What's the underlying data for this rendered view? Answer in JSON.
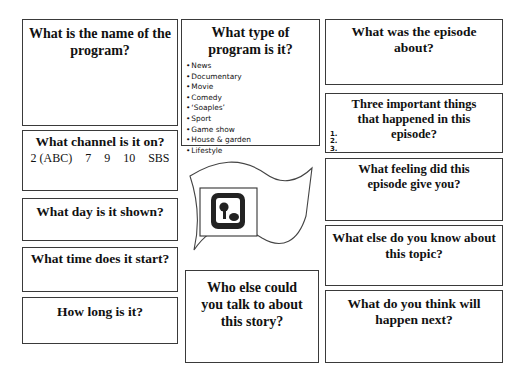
{
  "worksheet": {
    "program_name": {
      "question": "What is the name of the program?"
    },
    "program_type": {
      "question": "What type of program is it?",
      "options": [
        "News",
        "Documentary",
        "Movie",
        "Comedy",
        "‘Soaples’",
        "Sport",
        "Game show",
        "House & garden",
        "Lifestyle"
      ]
    },
    "episode_about": {
      "question": "What was the episode about?"
    },
    "three_things": {
      "question": "Three important things that happened in this episode?",
      "numbers": [
        "1.",
        "2.",
        "3."
      ]
    },
    "channel": {
      "question": "What channel is it on?",
      "options": [
        "2 (ABC)",
        "7",
        "9",
        "10",
        "SBS"
      ]
    },
    "day": {
      "question": "What day is it shown?"
    },
    "time": {
      "question": "What time does it start?"
    },
    "length": {
      "question": "How long is it?"
    },
    "who_else": {
      "question": "Who else could you talk to about this story?"
    },
    "feeling": {
      "question": "What feeling did this episode give you?"
    },
    "else_know": {
      "question": "What else do you know about this topic?"
    },
    "next": {
      "question": "What do you think will happen next?"
    },
    "center_icon": "tv-icon"
  }
}
